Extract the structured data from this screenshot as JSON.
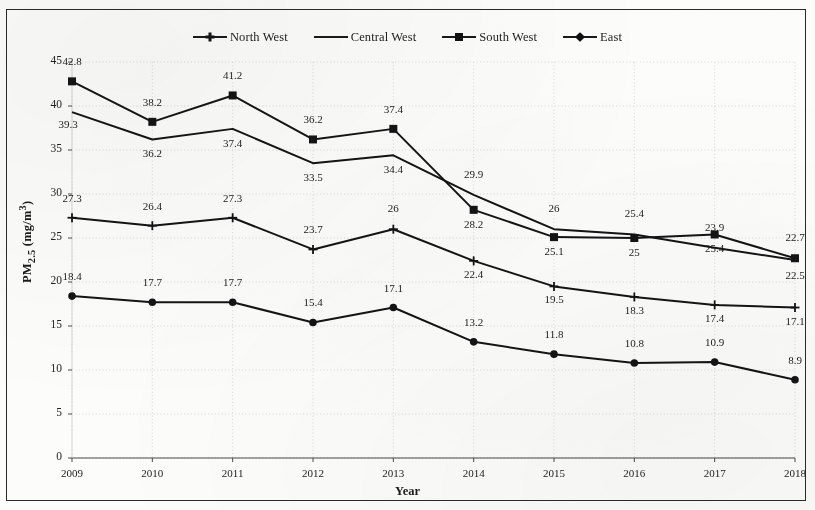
{
  "figure": {
    "y_axis_title": "PM2.5 (mg/m3)",
    "x_axis_title": "Year"
  },
  "legend": {
    "items": [
      {
        "label": "North West",
        "marker": "cross-marker"
      },
      {
        "label": "Central West",
        "marker": "line-marker"
      },
      {
        "label": "South West",
        "marker": "square-marker"
      },
      {
        "label": "East",
        "marker": "diamond-marker"
      }
    ]
  },
  "chart_data": {
    "type": "line",
    "title": "",
    "xlabel": "Year",
    "ylabel": "PM2.5 (mg/m3)",
    "categories": [
      "2009",
      "2010",
      "2011",
      "2012",
      "2013",
      "2014",
      "2015",
      "2016",
      "2017",
      "2018"
    ],
    "x": [
      2009,
      2010,
      2011,
      2012,
      2013,
      2014,
      2015,
      2016,
      2017,
      2018
    ],
    "ylim": [
      0,
      45
    ],
    "xlim": [
      2009,
      2018
    ],
    "ytick_labels": [
      "0",
      "5",
      "10",
      "15",
      "20",
      "25",
      "30",
      "35",
      "40",
      "45"
    ],
    "ytick_values": [
      0,
      5,
      10,
      15,
      20,
      25,
      30,
      35,
      40,
      45
    ],
    "grid": true,
    "legend_position": "top",
    "series": [
      {
        "name": "North West",
        "marker": "cross-marker",
        "values": [
          27.3,
          26.4,
          27.3,
          23.7,
          26,
          22.4,
          19.5,
          18.3,
          17.4,
          17.1
        ],
        "labels": [
          "27.3",
          "26.4",
          "27.3",
          "23.7",
          "26",
          "22.4",
          "19.5",
          "18.3",
          "17.4",
          "17.1"
        ]
      },
      {
        "name": "Central West",
        "marker": "line-marker",
        "values": [
          39.3,
          36.2,
          37.4,
          33.5,
          34.4,
          29.9,
          26,
          25.4,
          23.9,
          22.5
        ],
        "labels": [
          "39.3",
          "36.2",
          "37.4",
          "33.5",
          "34.4",
          "29.9",
          "26",
          "25.4",
          "23.9",
          "22.5"
        ]
      },
      {
        "name": "South West",
        "marker": "square-marker",
        "values": [
          42.8,
          38.2,
          41.2,
          36.2,
          37.4,
          28.2,
          25.1,
          25,
          25.4,
          22.7
        ],
        "labels": [
          "42.8",
          "38.2",
          "41.2",
          "36.2",
          "37.4",
          "28.2",
          "25.1",
          "25",
          "25.4",
          "22.7"
        ]
      },
      {
        "name": "East",
        "marker": "diamond-marker",
        "values": [
          18.4,
          17.7,
          17.7,
          15.4,
          17.1,
          13.2,
          11.8,
          10.8,
          10.9,
          8.9
        ],
        "labels": [
          "18.4",
          "17.7",
          "17.7",
          "15.4",
          "17.1",
          "13.2",
          "11.8",
          "10.8",
          "10.9",
          "8.9"
        ]
      }
    ],
    "colors": {
      "line": "#141414",
      "grid": "#cfcfcf",
      "axis": "#555555",
      "background": "#fcfcfa"
    }
  }
}
